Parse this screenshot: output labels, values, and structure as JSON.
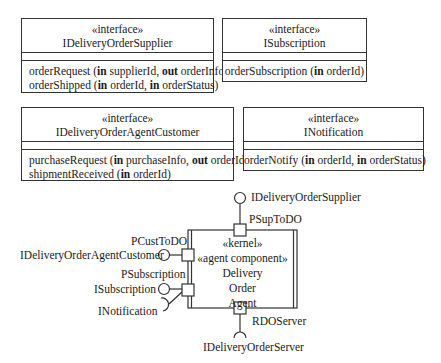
{
  "interfaces": [
    {
      "stereotype": "«interface»",
      "name": "IDeliveryOrderSupplier",
      "operations": [
        {
          "name": "orderRequest (",
          "params": [
            {
              "dir": "in",
              "name": " supplierId, "
            },
            {
              "dir": "out",
              "name": " orderInfo)"
            }
          ]
        },
        {
          "name": "orderShipped (",
          "params": [
            {
              "dir": "in",
              "name": " orderId, "
            },
            {
              "dir": "in",
              "name": " orderStatus)"
            }
          ]
        }
      ]
    },
    {
      "stereotype": "«interface»",
      "name": "ISubscription",
      "operations": [
        {
          "name": "orderSubscription (",
          "params": [
            {
              "dir": "in",
              "name": " orderId)"
            }
          ]
        }
      ]
    },
    {
      "stereotype": "«interface»",
      "name": "IDeliveryOrderAgentCustomer",
      "operations": [
        {
          "name": "purchaseRequest (",
          "params": [
            {
              "dir": "in",
              "name": " purchaseInfo, "
            },
            {
              "dir": "out",
              "name": " orderId)"
            }
          ]
        },
        {
          "name": "shipmentReceived (",
          "params": [
            {
              "dir": "in",
              "name": " orderId)"
            }
          ]
        }
      ]
    },
    {
      "stereotype": "«interface»",
      "name": "INotification",
      "operations": [
        {
          "name": "orderNotify (",
          "params": [
            {
              "dir": "in",
              "name": " orderId, "
            },
            {
              "dir": "in",
              "name": " orderStatus)"
            }
          ]
        }
      ]
    }
  ],
  "component": {
    "stereotypes": [
      "«kernel»",
      "«agent component»"
    ],
    "name_lines": [
      "Delivery",
      "Order",
      "Agent"
    ],
    "ports": {
      "top": {
        "name": "PSupToDO",
        "provided": "IDeliveryOrderSupplier"
      },
      "left_upper": {
        "name": "PCustToDO",
        "provided": "IDeliveryOrderAgentCustomer"
      },
      "left_lower": {
        "name": "PSubscription",
        "provided": "ISubscription",
        "required": "INotification"
      },
      "bottom": {
        "name": "RDOServer",
        "required": "IDeliveryOrderServer"
      }
    }
  },
  "colors": {
    "line": "#333333",
    "background": "#ffffff",
    "text": "#1a1a1a"
  }
}
